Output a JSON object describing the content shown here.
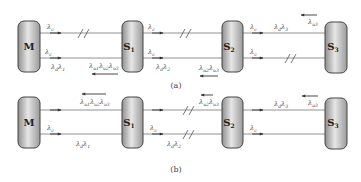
{
  "figure": {
    "panels": [
      {
        "id": "a",
        "caption": "(a)",
        "nodes": [
          {
            "id": "M",
            "label": "M",
            "sub": ""
          },
          {
            "id": "S1",
            "label": "S",
            "sub": "1"
          },
          {
            "id": "S2",
            "label": "S",
            "sub": "2"
          },
          {
            "id": "S3",
            "label": "S",
            "sub": "3"
          }
        ],
        "labels": {
          "m_upper": "λ",
          "m_upper_sub": "c",
          "m_lower": "λ",
          "m_lower_sub": "c",
          "m_lower2": "λ",
          "m_lower2_sub": "d",
          "m_lower2b": "λ",
          "m_lower2b_sub": "1",
          "ms1_return_1": "λ",
          "ms1_return_1_sub": "u1",
          "ms1_return_2": "λ",
          "ms1_return_2_sub": "u2",
          "ms1_return_3": "λ",
          "ms1_return_3_sub": "u3",
          "s1_upper": "λ",
          "s1_upper_sub": "c",
          "s1_lower": "λ",
          "s1_lower_sub": "c",
          "s1_lower2": "λ",
          "s1_lower2_sub": "d",
          "s1_lower2b": "λ",
          "s1_lower2b_sub": "2",
          "s1s2_return_1": "λ",
          "s1s2_return_1_sub": "u2",
          "s1s2_return_2": "λ",
          "s1s2_return_2_sub": "u3",
          "s2_upper": "λ",
          "s2_upper_sub": "c",
          "s2_upper2": "λ",
          "s2_upper2_sub": "d",
          "s2_upper2b": "λ",
          "s2_upper2b_sub": "3",
          "s2s3_return": "λ",
          "s2s3_return_sub": "u3",
          "s2_lower": "λ",
          "s2_lower_sub": "c"
        }
      },
      {
        "id": "b",
        "caption": "(b)",
        "nodes": [
          {
            "id": "M",
            "label": "M",
            "sub": ""
          },
          {
            "id": "S1",
            "label": "S",
            "sub": "1"
          },
          {
            "id": "S2",
            "label": "S",
            "sub": "2"
          },
          {
            "id": "S3",
            "label": "S",
            "sub": "3"
          }
        ],
        "labels": {
          "ms1_return_1": "λ",
          "ms1_return_1_sub": "u1",
          "ms1_return_2": "λ",
          "ms1_return_2_sub": "u2",
          "ms1_return_3": "λ",
          "ms1_return_3_sub": "u3",
          "m_lower": "λ",
          "m_lower_sub": "c",
          "m_lower2": "λ",
          "m_lower2_sub": "d",
          "m_lower2b": "λ",
          "m_lower2b_sub": "1",
          "s1_lower": "λ",
          "s1_lower_sub": "c",
          "s1_lower2": "λ",
          "s1_lower2_sub": "d",
          "s1_lower2b": "λ",
          "s1_lower2b_sub": "2",
          "s1s2_return_1": "λ",
          "s1s2_return_1_sub": "u2",
          "s1s2_return_2": "λ",
          "s1s2_return_2_sub": "u3",
          "s2_upper2": "λ",
          "s2_upper2_sub": "d",
          "s2_upper2b": "λ",
          "s2_upper2b_sub": "3",
          "s2s3_return": "λ",
          "s2s3_return_sub": "u3",
          "s2_lower": "λ",
          "s2_lower_sub": "c"
        }
      }
    ],
    "colors": {
      "node_fill_light": "#e8e8e8",
      "node_fill_dark": "#8a8a8a",
      "line": "#777777",
      "text": "#333333"
    }
  }
}
